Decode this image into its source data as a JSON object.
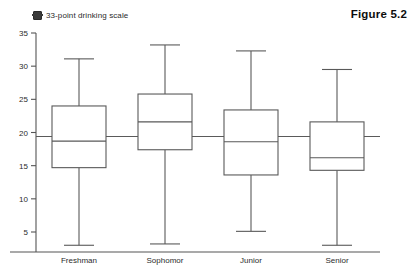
{
  "legend": {
    "marker_icon": "square-marker-icon",
    "label": "33-point drinking scale",
    "marker_color": "#3a3a3a"
  },
  "figure": {
    "title": "Figure 5.2"
  },
  "chart_data": {
    "type": "box",
    "title": "",
    "xlabel": "",
    "ylabel": "",
    "legend_entries": [
      "33-point drinking scale"
    ],
    "legend_position": "top-left",
    "grid": false,
    "ylim": [
      5,
      35
    ],
    "yticks": [
      5,
      10,
      15,
      20,
      25,
      30,
      35
    ],
    "ytick_labels": [
      "5",
      "10",
      "15",
      "20",
      "25",
      "30",
      "35"
    ],
    "categories": [
      "Freshman",
      "Sophomor",
      "Junior",
      "Senior"
    ],
    "reference_line": 19.4,
    "boxes": [
      {
        "category": "Freshman",
        "whisker_low": 3.0,
        "q1": 14.7,
        "median": 18.7,
        "q3": 24.0,
        "whisker_high": 31.1
      },
      {
        "category": "Sophomor",
        "whisker_low": 3.2,
        "q1": 17.4,
        "median": 21.6,
        "q3": 25.8,
        "whisker_high": 33.2
      },
      {
        "category": "Junior",
        "whisker_low": 5.1,
        "q1": 13.6,
        "median": 18.6,
        "q3": 23.4,
        "whisker_high": 32.3
      },
      {
        "category": "Senior",
        "whisker_low": 3.0,
        "q1": 14.3,
        "median": 16.2,
        "q3": 21.6,
        "whisker_high": 29.5
      }
    ]
  }
}
